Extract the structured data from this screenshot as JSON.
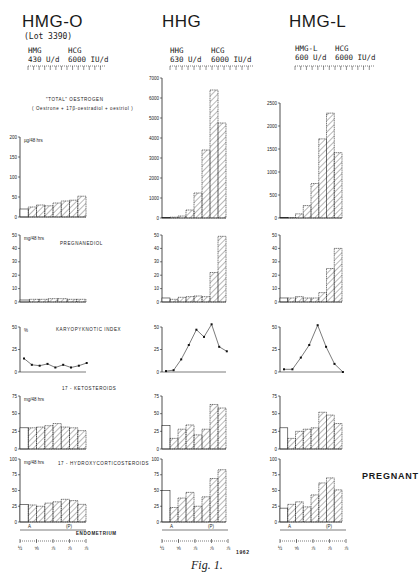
{
  "figure": {
    "caption": "Fig. 1.",
    "year_label": "1962",
    "pregnant_label": "PREGNANT",
    "endometrium_label": "ENDOMETRIUM",
    "endometrium_markers": {
      "A": "A",
      "P": "(P)"
    },
    "date_ticks": [
      "½",
      "⅝",
      "⅞",
      "⅞",
      "⅞"
    ]
  },
  "columns": [
    {
      "title": "HMG-O",
      "subtitle": "(Lot 3390)",
      "dose1_name": "HMG",
      "dose1_value": "430 U/d",
      "dose2_name": "HCG",
      "dose2_value": "6000 IU/d"
    },
    {
      "title": "HHG",
      "subtitle": "",
      "dose1_name": "HHG",
      "dose1_value": "630 U/d",
      "dose2_name": "HCG",
      "dose2_value": "6000 IU/d"
    },
    {
      "title": "HMG-L",
      "subtitle": "",
      "dose1_name": "HMG-L",
      "dose1_value": "600 U/d",
      "dose2_name": "HCG",
      "dose2_value": "6000 IU/d"
    }
  ],
  "panels": {
    "oestrogen": {
      "title": "\"TOTAL\" OESTROGEN",
      "subtitle": "( Oestrone + 17β-oestradiol + oestriol )",
      "unit": "µg/48 hrs"
    },
    "pregnanediol": {
      "title": "PREGNANEDIOL",
      "unit": "mg/48 hrs"
    },
    "karyo": {
      "title": "KARYOPYKNOTIC INDEX",
      "unit": "%"
    },
    "keto": {
      "title": "17 - KETOSTEROIDS",
      "unit": "mg/48 hrs"
    },
    "hydroxy": {
      "title": "17 - HYDROXYCORTICOSTEROIDS",
      "unit": "mg/48 hrs"
    }
  },
  "chart_data": [
    {
      "type": "bar",
      "title": "\"Total\" Oestrogen — HMG-O",
      "ylabel": "µg/48 hrs",
      "ylim": [
        0,
        200
      ],
      "yticks": [
        0,
        50,
        100,
        150,
        200
      ],
      "values": [
        20,
        25,
        30,
        28,
        35,
        40,
        42,
        52
      ]
    },
    {
      "type": "bar",
      "title": "\"Total\" Oestrogen — HHG",
      "ylabel": "µg/48 hrs",
      "ylim": [
        0,
        7000
      ],
      "yticks": [
        0,
        1000,
        2000,
        3000,
        4000,
        5000,
        6000,
        7000
      ],
      "values": [
        20,
        40,
        100,
        400,
        1250,
        3400,
        6400,
        4750
      ]
    },
    {
      "type": "bar",
      "title": "\"Total\" Oestrogen — HMG-L",
      "ylabel": "µg/48 hrs",
      "ylim": [
        0,
        2500
      ],
      "yticks": [
        0,
        500,
        1000,
        1500,
        2000,
        2500
      ],
      "values": [
        10,
        10,
        90,
        270,
        750,
        1720,
        2280,
        1420
      ]
    },
    {
      "type": "bar",
      "title": "Pregnanediol — HMG-O",
      "ylabel": "mg/48 hrs",
      "ylim": [
        0,
        50
      ],
      "yticks": [
        0,
        10,
        20,
        30,
        40,
        50
      ],
      "values": [
        1.5,
        2,
        2,
        2.5,
        2.5,
        2,
        2
      ]
    },
    {
      "type": "bar",
      "title": "Pregnanediol — HHG",
      "ylabel": "mg/48 hrs",
      "ylim": [
        0,
        50
      ],
      "yticks": [
        0,
        10,
        20,
        30,
        40,
        50
      ],
      "values": [
        3,
        2,
        3.5,
        4,
        4.5,
        4,
        22,
        49
      ]
    },
    {
      "type": "bar",
      "title": "Pregnanediol — HMG-L",
      "ylabel": "mg/48 hrs",
      "ylim": [
        0,
        50
      ],
      "yticks": [
        0,
        10,
        20,
        30,
        40,
        50
      ],
      "values": [
        3,
        3,
        4,
        3,
        3,
        7,
        25,
        40
      ]
    },
    {
      "type": "line",
      "title": "Karyopyknotic Index — HMG-O",
      "ylabel": "%",
      "ylim": [
        0,
        50
      ],
      "yticks": [
        0,
        25,
        50
      ],
      "values": [
        15,
        8,
        7,
        9,
        5,
        8,
        5,
        7,
        10
      ]
    },
    {
      "type": "line",
      "title": "Karyopyknotic Index — HHG",
      "ylabel": "%",
      "ylim": [
        0,
        50
      ],
      "yticks": [
        0,
        25,
        50
      ],
      "values": [
        1,
        2,
        14,
        30,
        47,
        39,
        53,
        28,
        23
      ]
    },
    {
      "type": "line",
      "title": "Karyopyknotic Index — HMG-L",
      "ylabel": "%",
      "ylim": [
        0,
        50
      ],
      "yticks": [
        0,
        25,
        50
      ],
      "values": [
        3,
        3,
        16,
        30,
        52,
        28,
        9,
        0
      ]
    },
    {
      "type": "bar",
      "title": "17-Ketosteroids — HMG-O",
      "ylabel": "mg/48 hrs",
      "ylim": [
        0,
        75
      ],
      "yticks": [
        0,
        25,
        50,
        75
      ],
      "values": [
        30,
        30,
        31,
        33,
        36,
        31,
        30,
        26
      ]
    },
    {
      "type": "bar",
      "title": "17-Ketosteroids — HHG",
      "ylabel": "mg/48 hrs",
      "ylim": [
        0,
        75
      ],
      "yticks": [
        0,
        25,
        50,
        75
      ],
      "values": [
        33,
        15,
        28,
        34,
        20,
        28,
        63,
        58
      ]
    },
    {
      "type": "bar",
      "title": "17-Ketosteroids — HMG-L",
      "ylabel": "mg/48 hrs",
      "ylim": [
        0,
        75
      ],
      "yticks": [
        0,
        25,
        50,
        75
      ],
      "values": [
        30,
        15,
        25,
        28,
        30,
        52,
        48,
        36
      ]
    },
    {
      "type": "bar",
      "title": "17-Hydroxycorticosteroids — HMG-O",
      "ylabel": "mg/48 hrs",
      "ylim": [
        0,
        100
      ],
      "yticks": [
        0,
        25,
        50,
        75,
        100
      ],
      "values": [
        28,
        27,
        25,
        30,
        32,
        36,
        34,
        28
      ]
    },
    {
      "type": "bar",
      "title": "17-Hydroxycorticosteroids — HHG",
      "ylabel": "mg/48 hrs",
      "ylim": [
        0,
        100
      ],
      "yticks": [
        0,
        25,
        50,
        75,
        100
      ],
      "values": [
        50,
        23,
        38,
        47,
        25,
        40,
        69,
        83
      ]
    },
    {
      "type": "bar",
      "title": "17-Hydroxycorticosteroids — HMG-L",
      "ylabel": "mg/48 hrs",
      "ylim": [
        0,
        100
      ],
      "yticks": [
        0,
        25,
        50,
        75,
        100
      ],
      "values": [
        22,
        28,
        32,
        24,
        43,
        62,
        70,
        51
      ]
    }
  ]
}
